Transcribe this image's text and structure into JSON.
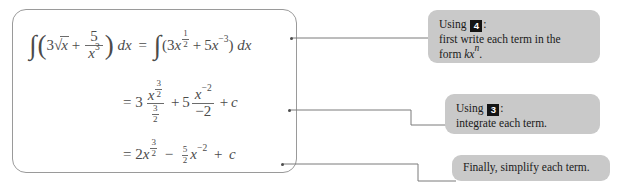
{
  "document": {
    "title": "Worked integration example with annotation callouts"
  },
  "equation_panel": {
    "name": "worked-example-box",
    "lines": [
      {
        "id": "line-1",
        "plain_text": "∫(3√x + 5/x³) dx = ∫(3x^(1/2) + 5x^(-3)) dx",
        "lhs": {
          "integral_sign": "∫",
          "paren_open": "(",
          "coefficient": "3",
          "radical": "√",
          "radicand": "x",
          "plus": "+",
          "fraction": {
            "numerator": "5",
            "denominator_base": "x",
            "denominator_exponent": "3"
          },
          "paren_close": ")",
          "differential": "dx"
        },
        "equals": "=",
        "rhs": {
          "integral_sign": "∫",
          "paren_open": "(",
          "term1_coefficient": "3",
          "term1_base": "x",
          "term1_exponent": {
            "numerator": "1",
            "denominator": "2"
          },
          "plus": "+",
          "term2_coefficient": "5",
          "term2_base": "x",
          "term2_exponent": "−3",
          "paren_close": ")",
          "differential": "dx"
        }
      },
      {
        "id": "line-2",
        "plain_text": "= 3 · x^(3/2)/(3/2) + 5 · x^(-2)/(-2) + c",
        "equals": "=",
        "term1_coefficient": "3",
        "term1_numerator_base": "x",
        "term1_numerator_exponent": {
          "numerator": "3",
          "denominator": "2"
        },
        "term1_denominator": {
          "numerator": "3",
          "denominator": "2"
        },
        "plus": "+",
        "term2_coefficient": "5",
        "term2_numerator_base": "x",
        "term2_numerator_exponent": "−2",
        "term2_denominator": "−2",
        "plus_c": "+",
        "constant": "c"
      },
      {
        "id": "line-3",
        "plain_text": "= 2x^(3/2) − (5/2)x^(-2) + c",
        "equals": "=",
        "term1_coefficient": "2",
        "term1_base": "x",
        "term1_exponent": {
          "numerator": "3",
          "denominator": "2"
        },
        "minus": "−",
        "term2_coefficient": {
          "numerator": "5",
          "denominator": "2"
        },
        "term2_base": "x",
        "term2_exponent": "−2",
        "plus_c": "+",
        "constant": "c"
      }
    ]
  },
  "notes": [
    {
      "id": "note-1",
      "prefix": "Using",
      "badge": "4",
      "colon": ":",
      "body_line_1": "first write each term in the",
      "body_line_2_prefix": "form ",
      "body_line_2_math": "kx",
      "body_line_2_exponent": "n",
      "body_line_2_suffix": "."
    },
    {
      "id": "note-2",
      "prefix": "Using",
      "badge": "3",
      "colon": ":",
      "body_line_1": "integrate each term."
    },
    {
      "id": "note-3",
      "body_line_1": "Finally, simplify each term."
    }
  ],
  "colors": {
    "note_background": "#c9c9c9",
    "panel_border": "#9a9a9a",
    "math_text": "#4b4b4b",
    "note_text": "#1a1a1a",
    "badge_background": "#141414",
    "connector_line": "#7a7a7a"
  }
}
